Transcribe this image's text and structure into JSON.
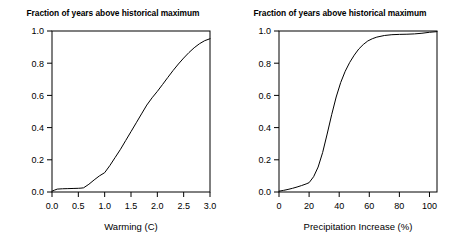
{
  "figure": {
    "width": 453,
    "height": 250,
    "background": "#ffffff",
    "foreground": "#000000"
  },
  "chart_data": [
    {
      "type": "line",
      "panel": "left",
      "title": "Fraction of years above historical maximum",
      "xlabel": "Warming (C)",
      "ylabel": "",
      "xlim": [
        0.0,
        3.0
      ],
      "ylim": [
        0.0,
        1.0
      ],
      "grid": false,
      "legend": "none",
      "xticks": [
        0.0,
        0.5,
        1.0,
        1.5,
        2.0,
        2.5,
        3.0
      ],
      "xticklabels": [
        "0.0",
        "0.5",
        "1.0",
        "1.5",
        "2.0",
        "2.5",
        "3.0"
      ],
      "yticks": [
        0.0,
        0.2,
        0.4,
        0.6,
        0.8,
        1.0
      ],
      "yticklabels": [
        "0.0",
        "0.2",
        "0.4",
        "0.6",
        "0.8",
        "1.0"
      ],
      "series": [
        {
          "name": "fraction-above-historical-maximum-warming",
          "color": "#000000",
          "x": [
            0.0,
            0.05,
            0.1,
            0.2,
            0.3,
            0.4,
            0.5,
            0.55,
            0.6,
            0.7,
            0.8,
            0.9,
            1.0,
            1.1,
            1.2,
            1.3,
            1.4,
            1.5,
            1.6,
            1.7,
            1.8,
            1.9,
            2.0,
            2.1,
            2.2,
            2.3,
            2.4,
            2.5,
            2.6,
            2.7,
            2.8,
            2.9,
            3.0
          ],
          "y": [
            0.005,
            0.012,
            0.018,
            0.02,
            0.021,
            0.022,
            0.023,
            0.024,
            0.026,
            0.048,
            0.075,
            0.1,
            0.12,
            0.165,
            0.215,
            0.265,
            0.32,
            0.375,
            0.43,
            0.485,
            0.54,
            0.585,
            0.625,
            0.668,
            0.712,
            0.755,
            0.795,
            0.832,
            0.866,
            0.896,
            0.921,
            0.94,
            0.952
          ]
        }
      ]
    },
    {
      "type": "line",
      "panel": "right",
      "title": "Fraction of years above historical maximum",
      "xlabel": "Precipitation Increase (%)",
      "ylabel": "",
      "xlim": [
        0,
        105
      ],
      "ylim": [
        0.0,
        1.0
      ],
      "grid": false,
      "legend": "none",
      "xticks": [
        0,
        20,
        40,
        60,
        80,
        100
      ],
      "xticklabels": [
        "0",
        "20",
        "40",
        "60",
        "80",
        "100"
      ],
      "yticks": [
        0.0,
        0.2,
        0.4,
        0.6,
        0.8,
        1.0
      ],
      "yticklabels": [
        "0.0",
        "0.2",
        "0.4",
        "0.6",
        "0.8",
        "1.0"
      ],
      "series": [
        {
          "name": "fraction-above-historical-maximum-precipitation",
          "color": "#000000",
          "x": [
            0,
            3,
            6,
            9,
            12,
            15,
            18,
            20,
            23,
            26,
            29,
            32,
            35,
            38,
            41,
            44,
            47,
            50,
            53,
            56,
            59,
            62,
            65,
            70,
            75,
            80,
            85,
            90,
            95,
            100,
            105
          ],
          "y": [
            0.005,
            0.01,
            0.016,
            0.023,
            0.031,
            0.04,
            0.05,
            0.058,
            0.095,
            0.155,
            0.245,
            0.36,
            0.48,
            0.59,
            0.68,
            0.75,
            0.805,
            0.85,
            0.888,
            0.916,
            0.938,
            0.952,
            0.962,
            0.972,
            0.977,
            0.979,
            0.98,
            0.982,
            0.986,
            0.992,
            0.996
          ]
        }
      ]
    }
  ]
}
